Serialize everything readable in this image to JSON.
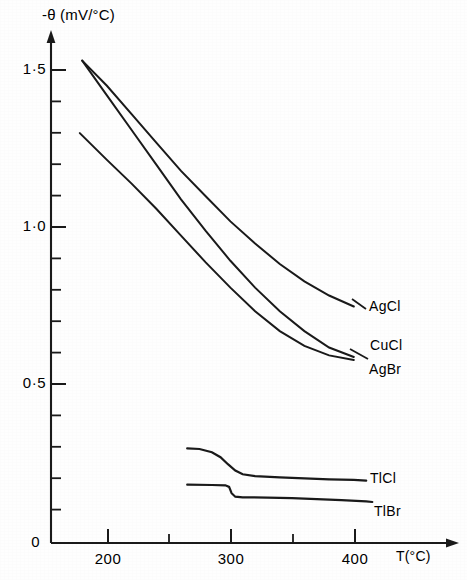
{
  "chart_data": {
    "type": "line",
    "title": "",
    "subtitle": "",
    "xlabel": "T(°C)",
    "ylabel": "-θ (mV/°C)",
    "ylabel_symbol": "θ",
    "ylabel_prefix": "-",
    "ylabel_units": "(mV/°C)",
    "xlim": [
      155,
      430
    ],
    "ylim": [
      0,
      1.62
    ],
    "grid": false,
    "legend_position": "inline-right-of-curve-ends",
    "x_major_ticks": [
      200,
      300,
      400
    ],
    "x_major_tick_labels": [
      "200",
      "300",
      "400"
    ],
    "x_minor_ticks": [
      250,
      350
    ],
    "y_major_ticks": [
      0,
      0.5,
      1.0,
      1.5
    ],
    "y_major_tick_labels": [
      "0",
      "0·5",
      "1·0",
      "1·5"
    ],
    "y_minor_ticks": [
      0.1,
      0.2,
      0.3,
      0.4,
      0.6,
      0.7,
      0.8,
      0.9,
      1.1,
      1.2,
      1.3,
      1.4
    ],
    "axis_arrows": {
      "x": "right",
      "y": "up"
    },
    "series": [
      {
        "name": "AgCl",
        "label": "AgCl",
        "x": [
          180,
          200,
          220,
          240,
          260,
          280,
          300,
          320,
          340,
          360,
          380,
          400
        ],
        "values": [
          1.53,
          1.45,
          1.36,
          1.27,
          1.18,
          1.1,
          1.02,
          0.95,
          0.885,
          0.83,
          0.785,
          0.75
        ]
      },
      {
        "name": "CuCl",
        "label": "CuCl",
        "x": [
          180,
          200,
          220,
          240,
          260,
          280,
          300,
          320,
          340,
          360,
          380,
          400
        ],
        "values": [
          1.53,
          1.42,
          1.31,
          1.2,
          1.09,
          0.99,
          0.895,
          0.81,
          0.735,
          0.672,
          0.62,
          0.59
        ]
      },
      {
        "name": "AgBr",
        "label": "AgBr",
        "x": [
          178,
          200,
          220,
          240,
          260,
          280,
          300,
          320,
          340,
          360,
          380,
          400
        ],
        "values": [
          1.3,
          1.215,
          1.14,
          1.06,
          0.975,
          0.89,
          0.81,
          0.735,
          0.672,
          0.625,
          0.595,
          0.58
        ]
      },
      {
        "name": "TlCl",
        "label": "TlCl",
        "x": [
          265,
          275,
          285,
          292,
          298,
          304,
          310,
          320,
          340,
          360,
          380,
          400,
          410
        ],
        "values": [
          0.3,
          0.298,
          0.288,
          0.272,
          0.25,
          0.23,
          0.218,
          0.212,
          0.208,
          0.205,
          0.202,
          0.2,
          0.198
        ]
      },
      {
        "name": "TlBr",
        "label": "TlBr",
        "x": [
          265,
          285,
          296,
          299,
          301,
          304,
          310,
          330,
          350,
          370,
          390,
          410,
          415
        ],
        "values": [
          0.185,
          0.184,
          0.183,
          0.178,
          0.158,
          0.147,
          0.145,
          0.144,
          0.142,
          0.139,
          0.136,
          0.132,
          0.13
        ]
      }
    ],
    "annotations": [
      {
        "text": "AgCl",
        "at_x": 400,
        "at_y": 0.75
      },
      {
        "text": "CuCl",
        "at_x": 400,
        "at_y": 0.59
      },
      {
        "text": "AgBr",
        "at_x": 400,
        "at_y": 0.58
      },
      {
        "text": "TlCl",
        "at_x": 410,
        "at_y": 0.198
      },
      {
        "text": "TlBr",
        "at_x": 415,
        "at_y": 0.13
      }
    ]
  },
  "labels": {
    "y_axis_title": "-θ (mV/°C)",
    "x_axis_title": "T(°C)",
    "y_ticks": [
      "1·5",
      "1·0",
      "0·5",
      "0"
    ],
    "x_ticks": [
      "200",
      "300",
      "400"
    ],
    "curves": [
      "AgCl",
      "CuCl",
      "AgBr",
      "TlCl",
      "TlBr"
    ]
  },
  "colors": {
    "ink": "#1a1a1a",
    "paper": "#fefefe"
  }
}
